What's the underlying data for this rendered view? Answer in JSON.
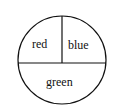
{
  "diagram": {
    "type": "spinner",
    "sections": [
      {
        "label": "red",
        "fraction": 0.25,
        "position": "top-left"
      },
      {
        "label": "blue",
        "fraction": 0.25,
        "position": "top-right"
      },
      {
        "label": "green",
        "fraction": 0.5,
        "position": "bottom"
      }
    ],
    "stroke_color": "#111111",
    "background": "#ffffff"
  }
}
